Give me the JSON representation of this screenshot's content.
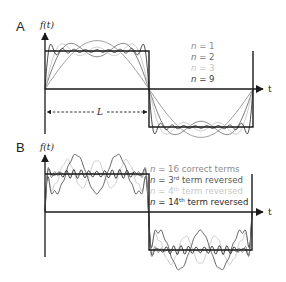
{
  "panels": {
    "A": {
      "label": "A",
      "y_axis_label": "f(t)",
      "x_axis_label": "t",
      "period_label": "L",
      "legend": [
        {
          "var": "n",
          "eq": " = 1",
          "color": "#8c8c8c"
        },
        {
          "var": "n",
          "eq": " = 2",
          "color": "#6e6e6e"
        },
        {
          "var": "n",
          "eq": " = 3",
          "color": "#c4c4c4"
        },
        {
          "var": "n",
          "eq": " = 9",
          "color": "#3a3a3a"
        }
      ]
    },
    "B": {
      "label": "B",
      "y_axis_label": "f(t)",
      "x_axis_label": "t",
      "legend": [
        {
          "var": "n",
          "pre": " = 16 correct terms",
          "num": "",
          "sup": "",
          "post": "",
          "color": "#8c8c8c"
        },
        {
          "var": "n",
          "pre": " = ",
          "num": "3",
          "sup": "rd",
          "post": " term reversed",
          "color": "#555555"
        },
        {
          "var": "n",
          "pre": " = ",
          "num": "4",
          "sup": "th",
          "post": " term reversed",
          "color": "#c8c8c8"
        },
        {
          "var": "n",
          "pre": " = ",
          "num": "14",
          "sup": "th",
          "post": " term reversed",
          "color": "#2a2a2a"
        }
      ]
    }
  },
  "colors": {
    "axis": "#1a1a1a",
    "square_wave": "#1a1a1a"
  }
}
